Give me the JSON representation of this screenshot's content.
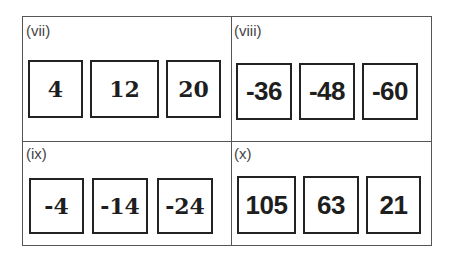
{
  "panels": [
    {
      "label": "(vii)",
      "values": [
        "4",
        "12",
        "20"
      ]
    },
    {
      "label": "(viii)",
      "values": [
        "-36",
        "-48",
        "-60"
      ]
    },
    {
      "label": "(ix)",
      "values": [
        "-4",
        "-14",
        "-24"
      ]
    },
    {
      "label": "(x)",
      "values": [
        "105",
        "63",
        "21"
      ]
    }
  ]
}
